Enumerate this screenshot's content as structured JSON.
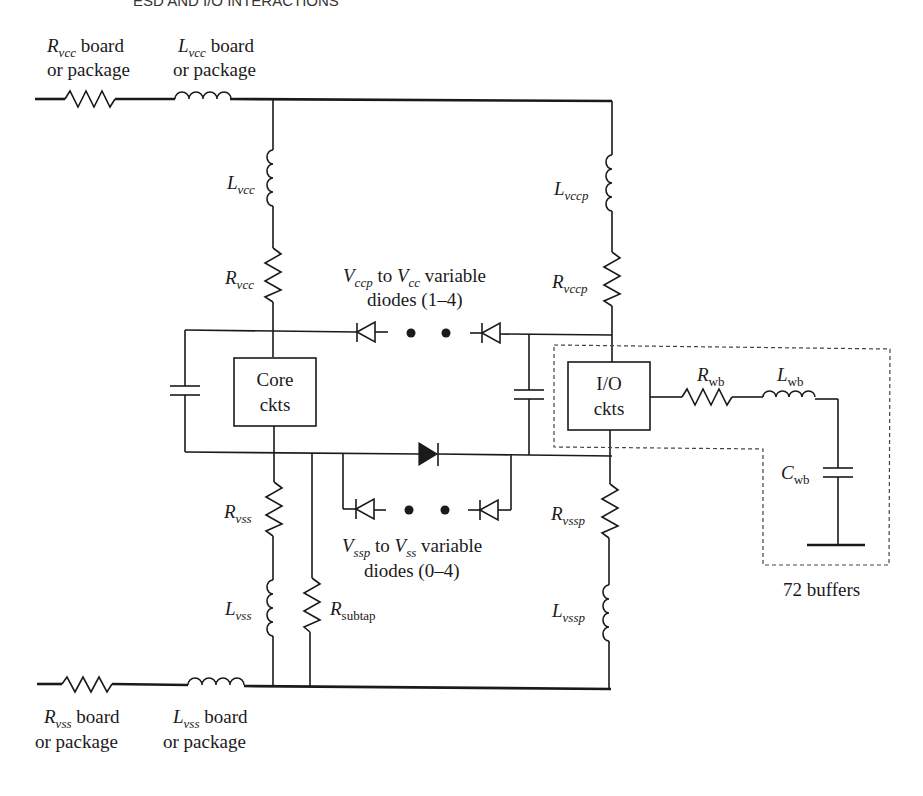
{
  "header": {
    "running_title": "ESD AND I/O INTERACTIONS"
  },
  "labels": {
    "rvcc_board": {
      "main": "R",
      "sub": "vcc",
      "line1": " board",
      "line2": "or package"
    },
    "lvcc_board": {
      "main": "L",
      "sub": "vcc",
      "line1": " board",
      "line2": "or package"
    },
    "rvss_board": {
      "main": "R",
      "sub": "vss",
      "line1": " board",
      "line2": "or package"
    },
    "lvss_board": {
      "main": "L",
      "sub": "vss",
      "line1": " board",
      "line2": "or package"
    },
    "lvcc": {
      "main": "L",
      "sub": "vcc"
    },
    "rvcc": {
      "main": "R",
      "sub": "vcc"
    },
    "lvccp": {
      "main": "L",
      "sub": "vccp"
    },
    "rvccp": {
      "main": "R",
      "sub": "vccp"
    },
    "rvss": {
      "main": "R",
      "sub": "vss"
    },
    "lvss": {
      "main": "L",
      "sub": "vss"
    },
    "rvssp": {
      "main": "R",
      "sub": "vssp"
    },
    "lvssp": {
      "main": "L",
      "sub": "vssp"
    },
    "rsubtap": {
      "main": "R",
      "sub": "subtap"
    },
    "rwb": {
      "main": "R",
      "sub": "wb"
    },
    "lwb": {
      "main": "L",
      "sub": "wb"
    },
    "cwb": {
      "main": "C",
      "sub": "wb"
    },
    "upper_diodes": {
      "v1": "V",
      "s1": "ccp",
      "mid": " to ",
      "v2": "V",
      "s2": "cc",
      "tail": " variable",
      "line2": "diodes (1–4)"
    },
    "lower_diodes": {
      "v1": "V",
      "s1": "ssp",
      "mid": " to ",
      "v2": "V",
      "s2": "ss",
      "tail": " variable",
      "line2": "diodes (0–4)"
    },
    "core_box": {
      "line1": "Core",
      "line2": "ckts"
    },
    "io_box": {
      "line1": "I/O",
      "line2": "ckts"
    },
    "buffers": "72 buffers"
  }
}
